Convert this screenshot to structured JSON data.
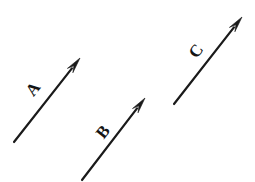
{
  "figure": {
    "type": "vector-diagram",
    "title": "",
    "background_color": "#ffffff",
    "stroke_color": "#1a1a1a",
    "canvas": {
      "width": 255,
      "height": 182
    }
  },
  "vectors": [
    {
      "label": "A",
      "tail": {
        "x": 14,
        "y": 142
      },
      "head": {
        "x": 80,
        "y": 58
      },
      "label_pos": {
        "x": 33,
        "y": 89
      },
      "label_rotation_deg": -52,
      "label_font_size": 17,
      "stroke_width": 2.2,
      "arrowhead_length": 16,
      "arrowhead_width": 7
    },
    {
      "label": "B",
      "tail": {
        "x": 82,
        "y": 180
      },
      "head": {
        "x": 145,
        "y": 98
      },
      "label_pos": {
        "x": 103,
        "y": 132
      },
      "label_rotation_deg": -52,
      "label_font_size": 17,
      "stroke_width": 2.2,
      "arrowhead_length": 16,
      "arrowhead_width": 7
    },
    {
      "label": "C",
      "tail": {
        "x": 174,
        "y": 104
      },
      "head": {
        "x": 242,
        "y": 17
      },
      "label_pos": {
        "x": 196,
        "y": 51
      },
      "label_rotation_deg": -52,
      "label_font_size": 17,
      "stroke_width": 2.2,
      "arrowhead_length": 16,
      "arrowhead_width": 7
    }
  ],
  "chart_data": {
    "type": "scatter",
    "title": "",
    "xlabel": "",
    "ylabel": "",
    "legend": [],
    "grid": false,
    "annotations": [
      "A",
      "B",
      "C"
    ],
    "series": [
      {
        "name": "A",
        "x": [
          14,
          80
        ],
        "y": [
          142,
          58
        ]
      },
      {
        "name": "B",
        "x": [
          82,
          145
        ],
        "y": [
          180,
          98
        ]
      },
      {
        "name": "C",
        "x": [
          174,
          242
        ],
        "y": [
          104,
          17
        ]
      }
    ]
  }
}
